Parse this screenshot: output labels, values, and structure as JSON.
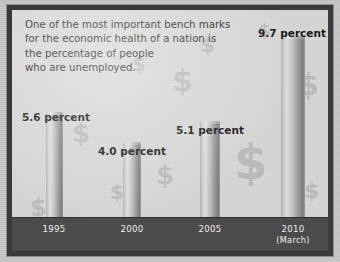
{
  "caption": {
    "lines": [
      "One of the most important bench marks",
      "for the economic health of a nation is",
      "the percentage of people",
      "who are unemployed."
    ]
  },
  "colors": {
    "page_background": "#c6c6c6",
    "frame": "#3a3a3a",
    "canvas": "#d5d5d3",
    "axis_band": "#4a4a4a",
    "axis_text": "#f0f0f0",
    "label_text": "#161616",
    "caption_text": "#242424",
    "bar_light": "#dedede",
    "bar_dark": "#7c7c7a",
    "watermark": "rgba(120,120,120,.30)"
  },
  "watermarks": [
    {
      "glyph": "$",
      "left": 60,
      "top": 110,
      "size": 26
    },
    {
      "glyph": "$",
      "left": 120,
      "top": 44,
      "size": 20
    },
    {
      "glyph": "$",
      "left": 160,
      "top": 56,
      "size": 30
    },
    {
      "glyph": "$",
      "left": 188,
      "top": 24,
      "size": 22
    },
    {
      "glyph": "$",
      "left": 98,
      "top": 172,
      "size": 20
    },
    {
      "glyph": "$",
      "left": 144,
      "top": 152,
      "size": 26
    },
    {
      "glyph": "$",
      "left": 18,
      "top": 186,
      "size": 24
    },
    {
      "glyph": "$",
      "left": 222,
      "top": 128,
      "size": 48
    },
    {
      "glyph": "$",
      "left": 286,
      "top": 60,
      "size": 30
    },
    {
      "glyph": "$",
      "left": 292,
      "top": 170,
      "size": 22
    },
    {
      "glyph": "$",
      "left": 246,
      "top": 12,
      "size": 18
    }
  ],
  "chart_data": {
    "type": "bar",
    "title": "",
    "subtitle": "",
    "xlabel": "",
    "ylabel": "percent unemployed",
    "unit": "percent",
    "ylim": [
      0,
      12
    ],
    "grid": false,
    "legend": null,
    "categories": [
      "1995",
      "2000",
      "2005",
      "2010"
    ],
    "category_sublabels": [
      "",
      "",
      "",
      "(March)"
    ],
    "values": [
      5.6,
      4.0,
      5.1,
      9.7
    ],
    "value_labels": [
      "5.6 percent",
      "4.0 percent",
      "5.1 percent",
      "9.7 percent"
    ],
    "bars": [
      {
        "category": "1995",
        "sublabel": "",
        "value": 5.6,
        "label": "5.6 percent",
        "left": 34,
        "width": 17,
        "label_left": 10,
        "label_top": 101
      },
      {
        "category": "2000",
        "sublabel": "",
        "value": 4.0,
        "label": "4.0 percent",
        "left": 111,
        "width": 18,
        "label_left": 86,
        "label_top": 135
      },
      {
        "category": "2005",
        "sublabel": "",
        "value": 5.1,
        "label": "5.1 percent",
        "left": 188,
        "width": 20,
        "label_left": 164,
        "label_top": 114
      },
      {
        "category": "2010",
        "sublabel": "(March)",
        "value": 9.7,
        "label": "9.7 percent",
        "left": 269,
        "width": 24,
        "label_left": 246,
        "label_top": 17
      }
    ],
    "axis_ticks": [
      {
        "label": "1995",
        "sublabel": "",
        "center": 42
      },
      {
        "label": "2000",
        "sublabel": "",
        "center": 120
      },
      {
        "label": "2005",
        "sublabel": "",
        "center": 198
      },
      {
        "label": "2010",
        "sublabel": "(March)",
        "center": 281
      }
    ]
  }
}
